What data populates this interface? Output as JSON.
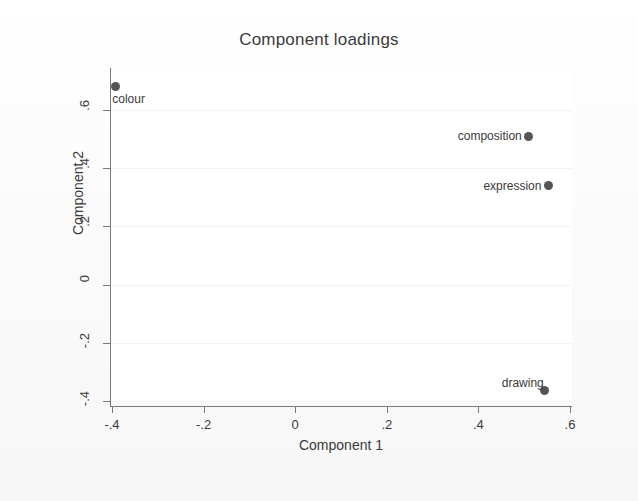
{
  "chart_data": {
    "type": "scatter",
    "title": "Component loadings",
    "xlabel": "Component 1",
    "ylabel": "Component 2",
    "xlim": [
      -0.45,
      0.63
    ],
    "ylim": [
      -0.44,
      0.73
    ],
    "xticks": [
      "-.4",
      "-.2",
      "0",
      ".2",
      ".4",
      ".6"
    ],
    "xtick_values": [
      -0.4,
      -0.2,
      0,
      0.2,
      0.4,
      0.6
    ],
    "yticks": [
      ".6",
      ".4",
      ".2",
      "0",
      "-.2",
      "-.4"
    ],
    "ytick_values": [
      0.6,
      0.4,
      0.2,
      0,
      -0.2,
      -0.4
    ],
    "grid": "horizontal",
    "legend": "none",
    "marker_color": "#555555",
    "axis_color": "#7a7a7a",
    "gridline_color": "#f2f2f2",
    "points": [
      {
        "label": "colour",
        "x": -0.393,
        "y": 0.68,
        "label_pos": "below-right"
      },
      {
        "label": "composition",
        "x": 0.51,
        "y": 0.51,
        "label_pos": "left"
      },
      {
        "label": "expression",
        "x": 0.553,
        "y": 0.34,
        "label_pos": "left"
      },
      {
        "label": "drawing",
        "x": 0.545,
        "y": -0.365,
        "label_pos": "above-left"
      }
    ]
  }
}
